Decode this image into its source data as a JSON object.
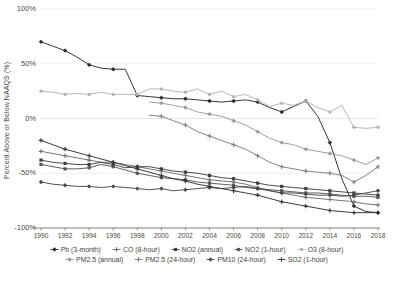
{
  "chart_data": {
    "type": "line",
    "title": "",
    "xlabel": "",
    "ylabel": "Percent Above or Below NAAQS (%)",
    "xlim": [
      1990,
      2018
    ],
    "ylim": [
      -100,
      100
    ],
    "grid": true,
    "legend_position": "bottom",
    "ytick_labels": [
      "100%",
      "50%",
      "0%",
      "-50%",
      "-100%"
    ],
    "ytick_values": [
      100,
      50,
      0,
      -50,
      -100
    ],
    "xtick_labels": [
      "1990",
      "1992",
      "1994",
      "1996",
      "1998",
      "2000",
      "2002",
      "2004",
      "2006",
      "2008",
      "2010",
      "2012",
      "2014",
      "2016",
      "2018"
    ],
    "x": [
      1990,
      1991,
      1992,
      1993,
      1994,
      1995,
      1996,
      1997,
      1998,
      1999,
      2000,
      2001,
      2002,
      2003,
      2004,
      2005,
      2006,
      2007,
      2008,
      2009,
      2010,
      2011,
      2012,
      2013,
      2014,
      2015,
      2016,
      2017,
      2018
    ],
    "series": [
      {
        "name": "Pb (3-month)",
        "color": "#2b2b2b",
        "marker": "diamond",
        "values": [
          70,
          66,
          62,
          56,
          49,
          46,
          45,
          45,
          21,
          20,
          19,
          18,
          18,
          17,
          16,
          15,
          16,
          17,
          15,
          10,
          6,
          11,
          16,
          2,
          -22,
          -55,
          -80,
          -85,
          -86
        ]
      },
      {
        "name": "CO (8-hour)",
        "color": "#6f6f6f",
        "marker": "cross",
        "values": [
          -30,
          -32,
          -34,
          -36,
          -38,
          -40,
          -40,
          -42,
          -44,
          -46,
          -48,
          -50,
          -52,
          -54,
          -56,
          -57,
          -58,
          -60,
          -63,
          -66,
          -68,
          -70,
          -72,
          -73,
          -74,
          -75,
          -76,
          -78,
          -79
        ]
      },
      {
        "name": "NO2 (annual)",
        "color": "#3f3f3f",
        "marker": "square",
        "values": [
          -38,
          -40,
          -41,
          -42,
          -42,
          -40,
          -42,
          -45,
          -44,
          -44,
          -46,
          -48,
          -49,
          -50,
          -52,
          -54,
          -55,
          -57,
          -59,
          -61,
          -62,
          -63,
          -64,
          -65,
          -66,
          -67,
          -68,
          -69,
          -70
        ]
      },
      {
        "name": "NO2 (1-hour)",
        "color": "#555555",
        "marker": "square",
        "values": [
          -42,
          -44,
          -46,
          -46,
          -45,
          -42,
          -44,
          -47,
          -50,
          -52,
          -54,
          -55,
          -56,
          -58,
          -59,
          -60,
          -61,
          -63,
          -64,
          -65,
          -66,
          -67,
          -68,
          -68,
          -69,
          -70,
          -71,
          -71,
          -72
        ]
      },
      {
        "name": "O3 (8-hour)",
        "color": "#b4b4b4",
        "marker": "circle",
        "values": [
          25,
          24,
          22,
          23,
          22,
          24,
          22,
          22,
          22,
          27,
          27,
          25,
          24,
          27,
          22,
          25,
          20,
          22,
          17,
          11,
          14,
          12,
          16,
          10,
          6,
          12,
          -8,
          -9,
          -8
        ]
      },
      {
        "name": "PM2.5 (annual)",
        "color": "#9b9b9b",
        "marker": "diamond",
        "values": [
          null,
          null,
          null,
          null,
          null,
          null,
          null,
          null,
          null,
          15,
          14,
          12,
          10,
          6,
          4,
          2,
          -2,
          -6,
          -12,
          -18,
          -22,
          -24,
          -28,
          -30,
          -32,
          -34,
          -38,
          -42,
          -36
        ]
      },
      {
        "name": "PM2.5 (24-hour)",
        "color": "#7d7d7d",
        "marker": "cross",
        "values": [
          null,
          null,
          null,
          null,
          null,
          null,
          null,
          null,
          null,
          3,
          2,
          -2,
          -6,
          -12,
          -16,
          -20,
          -24,
          -28,
          -34,
          -40,
          -44,
          -46,
          -48,
          -49,
          -50,
          -52,
          -58,
          -52,
          -44
        ]
      },
      {
        "name": "PM10 (24-hour)",
        "color": "#4a4a4a",
        "marker": "diamond",
        "values": [
          -58,
          -60,
          -61,
          -62,
          -62,
          -63,
          -62,
          -63,
          -64,
          -65,
          -64,
          -66,
          -65,
          -64,
          -63,
          -64,
          -63,
          -62,
          -64,
          -66,
          -68,
          -68,
          -69,
          -70,
          -70,
          -71,
          -70,
          -68,
          -66
        ]
      },
      {
        "name": "SO2 (1-hour)",
        "color": "#333333",
        "marker": "cross",
        "values": [
          -20,
          -24,
          -28,
          -31,
          -34,
          -37,
          -40,
          -43,
          -46,
          -49,
          -52,
          -55,
          -57,
          -60,
          -62,
          -64,
          -66,
          -68,
          -70,
          -73,
          -76,
          -78,
          -80,
          -82,
          -84,
          -85,
          -86,
          -86,
          -86
        ]
      }
    ]
  },
  "legend": {
    "row1": [
      "Pb (3-month)",
      "CO (8-hour)",
      "NO2 (annual)",
      "NO2 (1-hour)",
      "O3 (8-hour)"
    ],
    "row2": [
      "PM2.5 (annual)",
      "PM2.5 (24-hour)",
      "PM10 (24-hour)",
      "SO2 (1-hour)"
    ]
  }
}
